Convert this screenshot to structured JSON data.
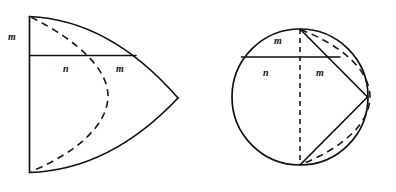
{
  "diagram": {
    "background_color": "#ffffff",
    "line_color": "#111111",
    "figures": [
      {
        "id": "left-figure",
        "name": "circular-sector-figure",
        "description": "Circular sector opening to the right with a vertical left edge, a horizontal chord, and a dashed circular arc bulging right",
        "labels": [
          {
            "key": "m_top",
            "text": "m",
            "x": 8,
            "y": 32
          },
          {
            "key": "n_mid",
            "text": "n",
            "x": 63,
            "y": 64
          },
          {
            "key": "m_mid",
            "text": "m",
            "x": 116,
            "y": 64
          }
        ]
      },
      {
        "id": "right-figure",
        "name": "circle-with-inscribed-kite-figure",
        "description": "Circle with a vertical dashed diameter, a dashed arc bulging right, a horizontal chord, and solid segments forming a kite to a right apex",
        "labels": [
          {
            "key": "m_top",
            "text": "m",
            "x": 274,
            "y": 36
          },
          {
            "key": "n_mid",
            "text": "n",
            "x": 263,
            "y": 68
          },
          {
            "key": "m_mid",
            "text": "m",
            "x": 316,
            "y": 68
          }
        ]
      }
    ],
    "symbols": {
      "m": "m",
      "n": "n"
    }
  }
}
